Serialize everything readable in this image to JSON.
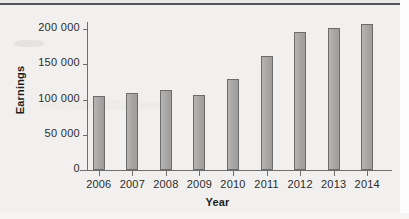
{
  "chart_data": {
    "type": "bar",
    "title": "",
    "xlabel": "Year",
    "ylabel": "Earnings",
    "categories": [
      "2006",
      "2007",
      "2008",
      "2009",
      "2010",
      "2011",
      "2012",
      "2013",
      "2014"
    ],
    "values": [
      105000,
      109000,
      114000,
      106000,
      129000,
      162000,
      196000,
      201000,
      207000
    ],
    "ylim": [
      0,
      210000
    ],
    "y_ticks": [
      0,
      50000,
      100000,
      150000,
      200000
    ],
    "y_tick_labels": [
      "0",
      "50 000",
      "100 000",
      "150 000",
      "200 000"
    ],
    "grid": false,
    "legend": null,
    "bar_color": "#a9a8a6",
    "bar_border_color": "#6d6c6c",
    "axis_color": "#6f6e6e",
    "background_color": "#f1f0ee"
  }
}
